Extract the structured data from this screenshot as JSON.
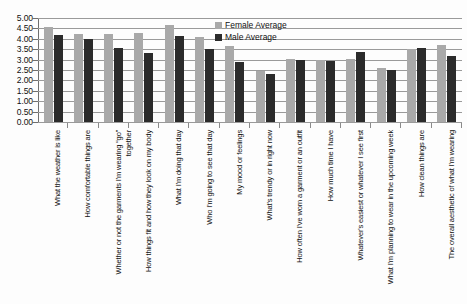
{
  "chart_data": {
    "type": "bar",
    "title": "",
    "xlabel": "",
    "ylabel": "",
    "ylim": [
      0,
      5
    ],
    "ytick_step": 0.5,
    "grid": true,
    "legend_position": "top-right",
    "y_ticks": [
      "0.00",
      "0.50",
      "1.00",
      "1.50",
      "2.00",
      "2.50",
      "3.00",
      "3.50",
      "4.00",
      "4.50",
      "5.00"
    ],
    "categories": [
      "What the weather is like",
      "How comfortable things are",
      "Whether or not the garments I'm wearing “go” together",
      "How things fit and how they look on my body",
      "What I'm doing that day",
      "Who I'm going to see that day",
      "My mood or feelings",
      "What's trendy or in right now",
      "How often I've worn a garment or an outfit",
      "How much time I have",
      "Whatever's easiest or whatever I see first",
      "What I'm planning to wear in the upcoming week",
      "How clean things are",
      "The overall aesthetic of what I'm wearing"
    ],
    "series": [
      {
        "name": "Female Average",
        "color": "#a9a9a9",
        "values": [
          4.55,
          4.25,
          4.25,
          4.27,
          4.65,
          4.07,
          3.65,
          2.45,
          3.05,
          3.0,
          3.02,
          2.6,
          3.52,
          3.7
        ]
      },
      {
        "name": "Male Average",
        "color": "#2b2b2b",
        "values": [
          4.2,
          4.0,
          3.55,
          3.3,
          4.15,
          3.5,
          2.9,
          2.3,
          3.0,
          2.95,
          3.35,
          2.5,
          3.55,
          3.15
        ]
      }
    ]
  },
  "legend": {
    "items": [
      {
        "label": "Female Average",
        "color": "#a9a9a9"
      },
      {
        "label": "Male Average",
        "color": "#2b2b2b"
      }
    ]
  }
}
